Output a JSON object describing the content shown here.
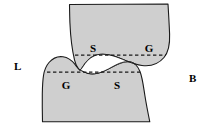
{
  "figure": {
    "name": "grain-boundary-wetting-diagram",
    "background_color": "#ffffff",
    "width": 211,
    "height": 132,
    "grain_fill_color": "#cfcfcf",
    "outline_color": "#1a1a1a",
    "dashed_line_color": "#1a1a1a",
    "gap_color": "#ffffff"
  },
  "side_labels": [
    {
      "id": "L",
      "text": "L",
      "x": 14,
      "y": 61
    },
    {
      "id": "B",
      "text": "B",
      "x": 189,
      "y": 73
    }
  ],
  "upper_grain": {
    "name": "upper-grain",
    "labels": [
      {
        "id": "upper-S",
        "text": "S",
        "x": 93,
        "y": 52
      },
      {
        "id": "upper-G",
        "text": "G",
        "x": 149,
        "y": 52
      }
    ],
    "dashed_line": {
      "x1": 75,
      "y1": 55,
      "x2": 166,
      "y2": 55
    }
  },
  "lower_grain": {
    "name": "lower-grain",
    "labels": [
      {
        "id": "lower-G",
        "text": "G",
        "x": 66,
        "y": 89
      },
      {
        "id": "lower-S",
        "text": "S",
        "x": 117,
        "y": 89
      }
    ],
    "dashed_line": {
      "x1": 47,
      "y1": 72,
      "x2": 140,
      "y2": 72
    }
  },
  "interface": {
    "name": "liquid-film-interface",
    "description": "thin curved gap separating upper and lower grains"
  }
}
